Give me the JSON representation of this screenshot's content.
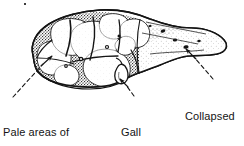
{
  "figure": {
    "subject": "liver",
    "style": "black-and-white stippled line drawing",
    "background_color": "#ffffff",
    "ink_color": "#141414",
    "width": 244,
    "height": 146
  },
  "labels": {
    "pale_areas": {
      "name": "pale-areas-of-regenerating-liver-tissue",
      "line1": "Pale areas of",
      "line2": "regenerating",
      "line3": "liver tissue"
    },
    "gall_bladder": {
      "name": "gall-bladder",
      "line1": "Gall",
      "line2": "bladder"
    },
    "collapsed_stroma": {
      "name": "collapsed-stroma",
      "line1": "Collapsed",
      "line2": "stroma"
    }
  },
  "leaders": [
    {
      "name": "leader-pale-areas",
      "from": [
        13,
        97
      ],
      "to": [
        50,
        58
      ],
      "style": "dashed-with-arrowhead"
    },
    {
      "name": "leader-gall-bladder",
      "from": [
        133,
        96
      ],
      "to": [
        120,
        80
      ],
      "style": "dashed-with-arrowhead"
    },
    {
      "name": "leader-collapsed-stroma",
      "from": [
        213,
        79
      ],
      "to": [
        186,
        49
      ],
      "style": "dashed-with-arrowhead"
    }
  ],
  "anatomy": {
    "nodules_note": "pale rounded regenerating nodules on left lobe",
    "stroma_note": "dark stippled fibrous bands between nodules",
    "right_lobe_note": "smooth shaded lobe with collapsed stroma pits"
  }
}
